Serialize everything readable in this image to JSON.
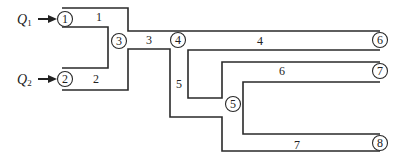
{
  "diagram": {
    "type": "pipe-network",
    "inflows": [
      {
        "symbol": "Q",
        "subscript": "1",
        "into_node": "1"
      },
      {
        "symbol": "Q",
        "subscript": "2",
        "into_node": "2"
      }
    ],
    "nodes": [
      {
        "id": "1",
        "label": "1"
      },
      {
        "id": "2",
        "label": "2"
      },
      {
        "id": "3",
        "label": "3"
      },
      {
        "id": "4",
        "label": "4"
      },
      {
        "id": "5",
        "label": "5"
      },
      {
        "id": "6",
        "label": "6"
      },
      {
        "id": "7",
        "label": "7"
      },
      {
        "id": "8",
        "label": "8"
      }
    ],
    "pipes": [
      {
        "label": "1",
        "from": "1",
        "to": "3"
      },
      {
        "label": "2",
        "from": "2",
        "to": "3"
      },
      {
        "label": "3",
        "from": "3",
        "to": "4"
      },
      {
        "label": "4",
        "from": "4",
        "to": "6"
      },
      {
        "label": "5",
        "from": "4",
        "to": "5"
      },
      {
        "label": "6",
        "from": "5",
        "to": "7"
      },
      {
        "label": "7",
        "from": "5",
        "to": "8"
      }
    ],
    "colors": {
      "line": "#2a2a2a",
      "background": "#ffffff"
    }
  }
}
